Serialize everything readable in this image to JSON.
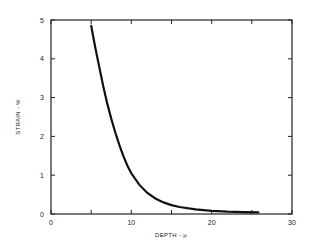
{
  "chart_data": {
    "type": "line",
    "title": "",
    "xlabel": "DEPTH - μ",
    "ylabel": "STRAIN - %",
    "xlim": [
      0,
      30
    ],
    "ylim": [
      0,
      5
    ],
    "xticks": [
      0,
      10,
      20,
      30
    ],
    "xticks_minor": [
      5,
      15,
      25
    ],
    "yticks": [
      0,
      1,
      2,
      3,
      4,
      5
    ],
    "grid": false,
    "legend": null,
    "series": [
      {
        "name": "strain vs depth",
        "x": [
          5.0,
          5.5,
          6.0,
          6.5,
          7.0,
          7.5,
          8.0,
          8.5,
          9.0,
          9.5,
          10.0,
          11.0,
          12.0,
          13.0,
          14.0,
          15.0,
          16.0,
          18.0,
          20.0,
          22.0,
          24.0,
          25.8
        ],
        "y": [
          4.85,
          4.3,
          3.8,
          3.3,
          2.85,
          2.45,
          2.1,
          1.78,
          1.5,
          1.25,
          1.05,
          0.75,
          0.54,
          0.4,
          0.3,
          0.23,
          0.18,
          0.12,
          0.08,
          0.06,
          0.05,
          0.04
        ]
      }
    ]
  }
}
